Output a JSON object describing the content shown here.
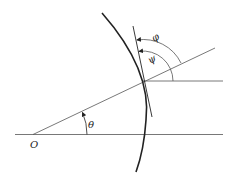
{
  "diagram": {
    "labels": {
      "origin": "O",
      "theta": "θ",
      "psi": "ψ",
      "phi": "φ"
    },
    "colors": {
      "stroke": "#222222",
      "thin_stroke": "#555555",
      "background": "#ffffff"
    }
  }
}
